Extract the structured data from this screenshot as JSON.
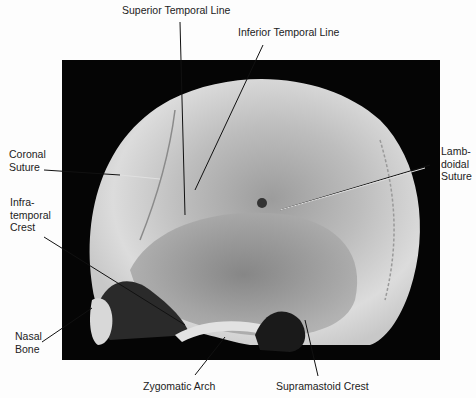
{
  "labels": {
    "superior_temporal_line": "Superior Temporal Line",
    "inferior_temporal_line": "Inferior Temporal Line",
    "coronal_suture": "Coronal\nSuture",
    "lambdoidal_suture": "Lamb-\ndoidal\nSuture",
    "infratemporal_crest": "Infra-\ntemporal\nCrest",
    "nasal_bone": "Nasal\nBone",
    "zygomatic_arch": "Zygomatic Arch",
    "supramastoid_crest": "Supramastoid Crest"
  },
  "colors": {
    "background": "#fdfdfd",
    "photo_bg": "#050505",
    "bone_light": "#e6e6e6",
    "bone_mid": "#b5b5b5",
    "bone_dark": "#6e6e6e",
    "leader_line": "#111111"
  }
}
